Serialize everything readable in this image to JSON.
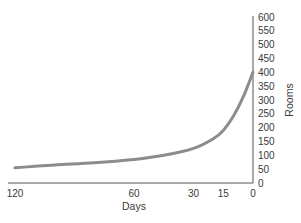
{
  "chart_data": {
    "type": "line",
    "title": "",
    "xlabel": "Days",
    "ylabel": "Rooms",
    "x_ticks": [
      120,
      60,
      30,
      15,
      0
    ],
    "y_ticks": [
      0,
      50,
      100,
      150,
      200,
      250,
      300,
      350,
      400,
      450,
      500,
      550,
      600
    ],
    "xlim": [
      120,
      0
    ],
    "ylim": [
      0,
      600
    ],
    "x_reversed": true,
    "y_axis_position": "right",
    "grid": false,
    "legend": null,
    "series": [
      {
        "name": "Rooms booked",
        "color": "#8c8c8c",
        "x": [
          120,
          100,
          80,
          60,
          45,
          30,
          20,
          15,
          10,
          5,
          0
        ],
        "y": [
          55,
          65,
          73,
          85,
          100,
          125,
          160,
          190,
          240,
          310,
          400
        ]
      }
    ]
  },
  "colors": {
    "axis": "#444444",
    "line": "#8c8c8c",
    "text": "#3a3a3a"
  }
}
